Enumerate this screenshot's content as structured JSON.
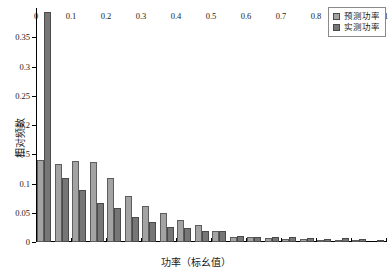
{
  "chart_data": {
    "type": "bar",
    "title": "",
    "subtitle": "",
    "xlabel": "功率（标幺值）",
    "ylabel": "相对频数",
    "xlim": [
      0,
      1
    ],
    "ylim": [
      0,
      0.4
    ],
    "grid": false,
    "legend_position": "top-right",
    "bin_width": 0.05,
    "x_tick_labels": [
      "0",
      "0.1",
      "0.2",
      "0.3",
      "0.4",
      "0.5",
      "0.6",
      "0.7",
      "0.8",
      "0.9",
      "1"
    ],
    "x_tick_values": [
      0,
      0.1,
      0.2,
      0.3,
      0.4,
      0.5,
      0.6,
      0.7,
      0.8,
      0.9,
      1
    ],
    "y_tick_labels": [
      "0",
      "0.05",
      "0.1",
      "0.15",
      "0.2",
      "0.25",
      "0.3",
      "0.35"
    ],
    "y_tick_values": [
      0,
      0.05,
      0.1,
      0.15,
      0.2,
      0.25,
      0.3,
      0.35
    ],
    "bin_centers": [
      0.025,
      0.075,
      0.125,
      0.175,
      0.225,
      0.275,
      0.325,
      0.375,
      0.425,
      0.475,
      0.525,
      0.575,
      0.625,
      0.675,
      0.725,
      0.775,
      0.825,
      0.875,
      0.925,
      0.975
    ],
    "series": [
      {
        "name": "预测功率",
        "color": "#a3a3a3",
        "values": [
          0.141,
          0.133,
          0.139,
          0.136,
          0.109,
          0.078,
          0.061,
          0.05,
          0.038,
          0.029,
          0.019,
          0.009,
          0.008,
          0.007,
          0.005,
          0.005,
          0.004,
          0.004,
          0.002,
          0.0
        ]
      },
      {
        "name": "实测功率",
        "color": "#767676",
        "values": [
          0.393,
          0.109,
          0.089,
          0.066,
          0.059,
          0.042,
          0.035,
          0.026,
          0.024,
          0.018,
          0.018,
          0.011,
          0.009,
          0.008,
          0.008,
          0.007,
          0.006,
          0.007,
          0.005,
          0.003
        ]
      }
    ]
  },
  "legend": {
    "items": [
      {
        "label": "预测功率",
        "swatch": "pred"
      },
      {
        "label": "实测功率",
        "swatch": "meas"
      }
    ]
  }
}
